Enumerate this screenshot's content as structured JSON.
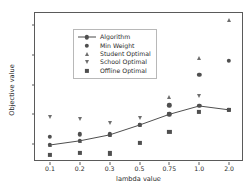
{
  "chart_data": {
    "type": "scatter",
    "title": "",
    "xlabel": "lambda value",
    "ylabel": "Objective value",
    "categories": [
      "0.1",
      "0.2",
      "0.3",
      "0.5",
      "0.75",
      "1.0",
      "2.0"
    ],
    "ylim": [
      640,
      1140
    ],
    "yticks": [
      700,
      800,
      900,
      1000,
      1100
    ],
    "grid": false,
    "legend_position": "upper left",
    "series": [
      {
        "name": "Algorithm",
        "marker": "circle-line",
        "color": "#4f4f4f",
        "values": [
          697,
          711,
          731,
          764,
          800,
          828,
          815
        ]
      },
      {
        "name": "Min Weight",
        "marker": "circle",
        "color": "#4f4f4f",
        "values": [
          725,
          733,
          733,
          764,
          830,
          933,
          980
        ]
      },
      {
        "name": "Student Optimal",
        "marker": "triangle-up",
        "color": "#6e6e6e",
        "values": [
          697,
          711,
          731,
          764,
          858,
          988,
          1115
        ]
      },
      {
        "name": "School Optimal",
        "marker": "triangle-down",
        "color": "#6e6e6e",
        "values": [
          790,
          785,
          770,
          789,
          800,
          862,
          815
        ]
      },
      {
        "name": "Offline Optimal",
        "marker": "square",
        "color": "#4f4f4f",
        "values": [
          663,
          670,
          669,
          703,
          740,
          808,
          815
        ]
      }
    ]
  },
  "legend": {
    "entries": [
      {
        "label": "Algorithm"
      },
      {
        "label": "Min Weight"
      },
      {
        "label": "Student Optimal"
      },
      {
        "label": "School Optimal"
      },
      {
        "label": "Offline Optimal"
      }
    ]
  },
  "axis": {
    "ytick_labels": [
      "1100",
      "1000",
      "900",
      "800",
      "700"
    ],
    "xtick_labels": [
      "0.1",
      "0.2",
      "0.3",
      "0.5",
      "0.75",
      "1.0",
      "2.0"
    ],
    "xlabel": "lambda value",
    "ylabel": "Objective value"
  }
}
